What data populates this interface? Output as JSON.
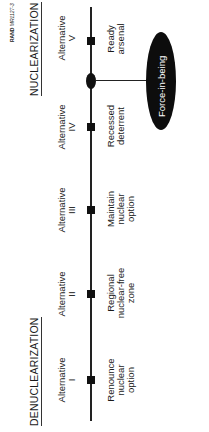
{
  "figure_id": {
    "prefix": "RAND",
    "code": "MR1127-3"
  },
  "sections": {
    "left": "DENUCLEARIZATION",
    "right": "NUCLEARIZATION"
  },
  "alternatives": [
    {
      "label": "Alternative",
      "numeral": "I",
      "desc1": "Renounce",
      "desc2": "nuclear",
      "desc3": "option"
    },
    {
      "label": "Alternative",
      "numeral": "II",
      "desc1": "Regional",
      "desc2": "nuclear-free",
      "desc3": "zone"
    },
    {
      "label": "Alternative",
      "numeral": "III",
      "desc1": "Maintain",
      "desc2": "nuclear",
      "desc3": "option"
    },
    {
      "label": "Alternative",
      "numeral": "IV",
      "desc1": "Recessed",
      "desc2": "deterrent",
      "desc3": ""
    },
    {
      "label": "Alternative",
      "numeral": "V",
      "desc1": "Ready",
      "desc2": "arsenal",
      "desc3": ""
    }
  ],
  "callout": {
    "label": "Force-in-being",
    "position": "between IV and V"
  }
}
